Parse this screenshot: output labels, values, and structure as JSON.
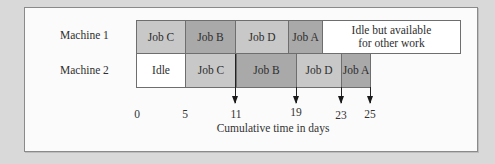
{
  "diagram": {
    "type": "gantt",
    "rows": [
      {
        "label": "Machine 1",
        "blocks": [
          {
            "label": "Job C",
            "start": 0,
            "end": 5
          },
          {
            "label": "Job B",
            "start": 5,
            "end": 11
          },
          {
            "label": "Job D",
            "start": 11,
            "end": 15
          },
          {
            "label": "Job A",
            "start": 15,
            "end": 17
          },
          {
            "label": "Idle but available for other work",
            "line1": "Idle but available",
            "line2": "for other work",
            "start": 17,
            "end": null
          }
        ]
      },
      {
        "label": "Machine 2",
        "blocks": [
          {
            "label": "Idle",
            "start": 0,
            "end": 5
          },
          {
            "label": "Job C",
            "start": 5,
            "end": 11
          },
          {
            "label": "Job B",
            "start": 11,
            "end": 19
          },
          {
            "label": "Job D",
            "start": 19,
            "end": 23
          },
          {
            "label": "Job A",
            "start": 23,
            "end": 25
          }
        ]
      }
    ],
    "axis": {
      "ticks": [
        "0",
        "5",
        "11",
        "19",
        "23",
        "25"
      ],
      "arrow_marks": [
        "11",
        "19",
        "23",
        "25"
      ],
      "label": "Cumulative time in days"
    }
  }
}
